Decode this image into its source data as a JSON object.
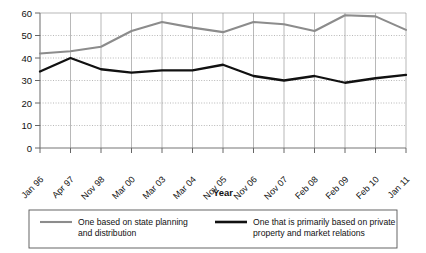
{
  "chart_data": {
    "type": "line",
    "title": "",
    "xlabel": "Year",
    "ylabel": "",
    "ylim": [
      0,
      60
    ],
    "yticks": [
      0,
      10,
      20,
      30,
      40,
      50,
      60
    ],
    "grid": true,
    "legend_position": "bottom",
    "categories": [
      "Jan 96",
      "Apr 97",
      "Nov 98",
      "Mar 00",
      "Mar 03",
      "Mar 04",
      "Nov 05",
      "Nov 06",
      "Nov 07",
      "Feb 08",
      "Feb 09",
      "Feb 10",
      "Jan 11"
    ],
    "series": [
      {
        "name": "One based on state planning and distribution",
        "color": "#8c8c8c",
        "values": [
          42,
          43,
          45,
          52,
          56,
          53.5,
          51.5,
          56,
          55,
          52,
          59,
          58.5,
          52.5
        ]
      },
      {
        "name": "One that is primarily based on private property and market relations",
        "color": "#111111",
        "values": [
          34,
          40,
          35,
          33.5,
          34.5,
          34.5,
          37,
          32,
          30,
          32,
          29,
          31,
          32.5
        ]
      }
    ]
  },
  "axis": {
    "y_tick_labels": [
      "60",
      "50",
      "40",
      "30",
      "20",
      "10",
      "0"
    ],
    "x_axis_title": "Year"
  },
  "legend": {
    "entries": [
      {
        "label_line1": "One based on state planning",
        "label_line2": "and distribution",
        "swatch": "gray-line-swatch"
      },
      {
        "label_line1": "One that is primarily based on private",
        "label_line2": "property and market relations",
        "swatch": "black-line-swatch"
      }
    ]
  }
}
